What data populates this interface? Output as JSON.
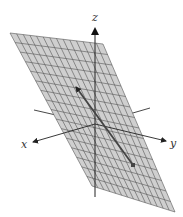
{
  "figure": {
    "colors": {
      "background": "#ffffff",
      "plane_fill": "#cfcfcf",
      "grid_line": "#555555",
      "axis": "#333333",
      "vector": "#444444"
    },
    "axes": {
      "x": {
        "label": "x"
      },
      "y": {
        "label": "y"
      },
      "z": {
        "label": "z"
      }
    },
    "plane": {
      "corners": [
        [
          10,
          33
        ],
        [
          103,
          44
        ],
        [
          175,
          212
        ],
        [
          92,
          186
        ]
      ],
      "grid_columns": 14,
      "grid_rows": 16
    },
    "origin": [
      95,
      124
    ],
    "vector": {
      "tail": [
        133,
        165
      ],
      "head": [
        76,
        87
      ]
    }
  }
}
